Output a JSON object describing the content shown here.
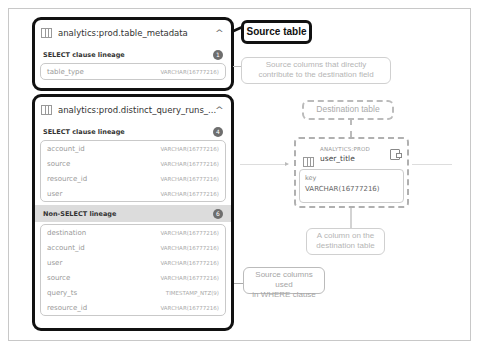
{
  "source_tables": [
    {
      "name": "analytics:prod.table_metadata",
      "sections": [
        {
          "label": "SELECT clause lineage",
          "count": "1",
          "columns": [
            {
              "name": "table_type",
              "type": "VARCHAR(16777216)"
            }
          ]
        }
      ]
    },
    {
      "name": "analytics:prod.distinct_query_runs_...",
      "sections": [
        {
          "label": "SELECT clause lineage",
          "count": "4",
          "columns": [
            {
              "name": "account_id",
              "type": "VARCHAR(16777216)"
            },
            {
              "name": "source",
              "type": "VARCHAR(16777216)"
            },
            {
              "name": "resource_id",
              "type": "VARCHAR(16777216)"
            },
            {
              "name": "user",
              "type": "VARCHAR(16777216)"
            }
          ]
        },
        {
          "label": "Non-SELECT lineage",
          "count": "6",
          "columns": [
            {
              "name": "destination",
              "type": "VARCHAR(16777216)"
            },
            {
              "name": "account_id",
              "type": "VARCHAR(16777216)"
            },
            {
              "name": "user",
              "type": "VARCHAR(16777216)"
            },
            {
              "name": "source",
              "type": "VARCHAR(16777216)"
            },
            {
              "name": "query_ts",
              "type": "TIMESTAMP_NTZ(9)"
            },
            {
              "name": "resource_id",
              "type": "VARCHAR(16777216)"
            }
          ]
        }
      ]
    }
  ],
  "destination_table": {
    "schema": "ANALYTICS:PROD",
    "name": "user_title",
    "column": {
      "name": "key",
      "type": "VARCHAR(16777216)"
    }
  },
  "annotations": {
    "source_table": "Source table",
    "direct_contrib_line1": "Source columns that directly",
    "direct_contrib_line2": "contribute to the destination field",
    "destination_table": "Destination table",
    "dest_column_line1": "A column on the",
    "dest_column_line2": "destination table",
    "where_line1": "Source columns used",
    "where_line2": "in WHERE clause"
  },
  "icons": {
    "table": "table-icon",
    "collapse": "chevron-up-icon",
    "open": "open-table-icon"
  }
}
